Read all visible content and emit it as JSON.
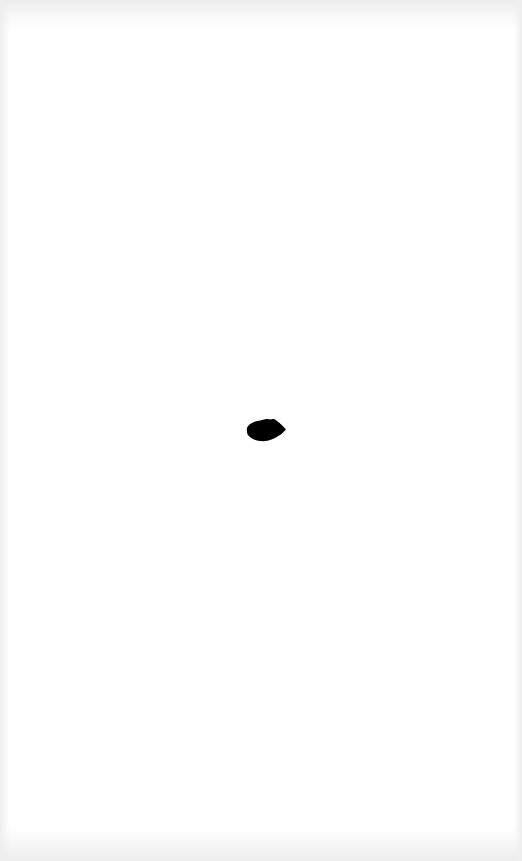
{
  "page": {
    "background": "#ffffff",
    "edge_shading": "#ececec"
  },
  "mark": {
    "shape": "ink-blot",
    "color": "#000000",
    "center": [
      266,
      430
    ],
    "size": [
      40,
      24
    ]
  }
}
